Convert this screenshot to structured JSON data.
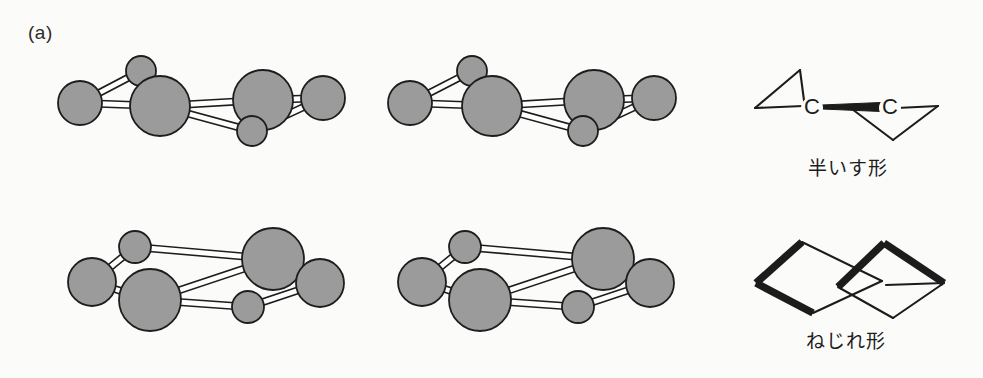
{
  "figure": {
    "panel_label": "(a)",
    "background_color": "#fbfbf9",
    "width": 983,
    "height": 378
  },
  "style": {
    "atom_fill": "#9b9b9b",
    "atom_stroke": "#1d1d1d",
    "bond_fill": "#fefefe",
    "bond_stroke": "#1d1d1d",
    "line_color": "#1c1c1c"
  },
  "rows": [
    {
      "name": "half-chair",
      "caption": "半いす形",
      "caption_romaji_meaning": "half-chair form",
      "stereo_pair": [
        {
          "view": "left-eye",
          "atoms": [
            {
              "id": "a1",
              "cx": 80,
              "cy": 103,
              "r": 22
            },
            {
              "id": "a2",
              "cx": 141,
              "cy": 71,
              "r": 15
            },
            {
              "id": "a3",
              "cx": 160,
              "cy": 106,
              "r": 30
            },
            {
              "id": "a4",
              "cx": 263,
              "cy": 100,
              "r": 30
            },
            {
              "id": "a5",
              "cx": 252,
              "cy": 131,
              "r": 15
            },
            {
              "id": "a6",
              "cx": 323,
              "cy": 98,
              "r": 22
            }
          ],
          "bonds": [
            {
              "from": "a1",
              "to": "a2"
            },
            {
              "from": "a1",
              "to": "a3"
            },
            {
              "from": "a2",
              "to": "a3"
            },
            {
              "from": "a3",
              "to": "a4"
            },
            {
              "from": "a3",
              "to": "a5"
            },
            {
              "from": "a4",
              "to": "a5"
            },
            {
              "from": "a4",
              "to": "a6"
            },
            {
              "from": "a5",
              "to": "a6"
            }
          ]
        },
        {
          "view": "right-eye",
          "atoms": [
            {
              "id": "b1",
              "cx": 410,
              "cy": 103,
              "r": 22
            },
            {
              "id": "b2",
              "cx": 472,
              "cy": 71,
              "r": 15
            },
            {
              "id": "b3",
              "cx": 492,
              "cy": 106,
              "r": 30
            },
            {
              "id": "b4",
              "cx": 594,
              "cy": 100,
              "r": 30
            },
            {
              "id": "b5",
              "cx": 583,
              "cy": 131,
              "r": 15
            },
            {
              "id": "b6",
              "cx": 654,
              "cy": 98,
              "r": 22
            }
          ],
          "bonds": [
            {
              "from": "b1",
              "to": "b2"
            },
            {
              "from": "b1",
              "to": "b3"
            },
            {
              "from": "b2",
              "to": "b3"
            },
            {
              "from": "b3",
              "to": "b4"
            },
            {
              "from": "b3",
              "to": "b5"
            },
            {
              "from": "b4",
              "to": "b5"
            },
            {
              "from": "b4",
              "to": "b6"
            },
            {
              "from": "b5",
              "to": "b6"
            }
          ]
        }
      ],
      "line_diagram": {
        "atom_labels": [
          "C",
          "C"
        ],
        "label_positions": [
          {
            "x": 812,
            "y": 108
          },
          {
            "x": 890,
            "y": 108
          }
        ],
        "thin_segments": [
          [
            [
              755,
              108
            ],
            [
              800,
              70
            ]
          ],
          [
            [
              800,
              70
            ],
            [
              805,
              108
            ]
          ],
          [
            [
              755,
              108
            ],
            [
              803,
              106
            ]
          ],
          [
            [
              897,
              108
            ],
            [
              938,
              106
            ]
          ],
          [
            [
              938,
              106
            ],
            [
              893,
              140
            ]
          ],
          [
            [
              893,
              140
            ],
            [
              848,
              106
            ]
          ]
        ],
        "wedge_bond": {
          "from": [
            822,
            107
          ],
          "to": [
            881,
            107
          ],
          "max_width": 9
        }
      }
    },
    {
      "name": "twist",
      "caption": "ねじれ形",
      "caption_romaji_meaning": "twist form",
      "stereo_pair": [
        {
          "view": "left-eye",
          "atoms": [
            {
              "id": "c1",
              "cx": 92,
              "cy": 282,
              "r": 24
            },
            {
              "id": "c2",
              "cx": 135,
              "cy": 247,
              "r": 16
            },
            {
              "id": "c3",
              "cx": 150,
              "cy": 300,
              "r": 31
            },
            {
              "id": "c4",
              "cx": 273,
              "cy": 259,
              "r": 31
            },
            {
              "id": "c5",
              "cx": 248,
              "cy": 307,
              "r": 16
            },
            {
              "id": "c6",
              "cx": 320,
              "cy": 283,
              "r": 24
            }
          ],
          "bonds": [
            {
              "from": "c1",
              "to": "c2"
            },
            {
              "from": "c1",
              "to": "c3"
            },
            {
              "from": "c2",
              "to": "c4"
            },
            {
              "from": "c3",
              "to": "c4"
            },
            {
              "from": "c3",
              "to": "c5"
            },
            {
              "from": "c5",
              "to": "c6"
            },
            {
              "from": "c4",
              "to": "c6"
            }
          ]
        },
        {
          "view": "right-eye",
          "atoms": [
            {
              "id": "d1",
              "cx": 422,
              "cy": 282,
              "r": 24
            },
            {
              "id": "d2",
              "cx": 465,
              "cy": 247,
              "r": 16
            },
            {
              "id": "d3",
              "cx": 480,
              "cy": 300,
              "r": 31
            },
            {
              "id": "d4",
              "cx": 603,
              "cy": 259,
              "r": 31
            },
            {
              "id": "d5",
              "cx": 578,
              "cy": 307,
              "r": 16
            },
            {
              "id": "d6",
              "cx": 650,
              "cy": 283,
              "r": 24
            }
          ],
          "bonds": [
            {
              "from": "d1",
              "to": "d2"
            },
            {
              "from": "d1",
              "to": "d3"
            },
            {
              "from": "d2",
              "to": "d4"
            },
            {
              "from": "d3",
              "to": "d4"
            },
            {
              "from": "d3",
              "to": "d5"
            },
            {
              "from": "d5",
              "to": "d6"
            },
            {
              "from": "d4",
              "to": "d6"
            }
          ]
        }
      ],
      "line_diagram": {
        "thin_segments": [
          [
            [
              802,
              242
            ],
            [
              882,
              281
            ]
          ],
          [
            [
              882,
              281
            ],
            [
              813,
              313
            ]
          ],
          [
            [
              886,
              285
            ],
            [
              944,
              283
            ]
          ],
          [
            [
              944,
              283
            ],
            [
              893,
              318
            ]
          ],
          [
            [
              893,
              318
            ],
            [
              838,
              287
            ]
          ]
        ],
        "bold_segments": [
          [
            [
              802,
              242
            ],
            [
              756,
              283
            ]
          ],
          [
            [
              756,
              283
            ],
            [
              813,
              313
            ]
          ],
          [
            [
              838,
              287
            ],
            [
              884,
              243
            ]
          ],
          [
            [
              884,
              243
            ],
            [
              944,
              283
            ]
          ]
        ]
      }
    }
  ]
}
